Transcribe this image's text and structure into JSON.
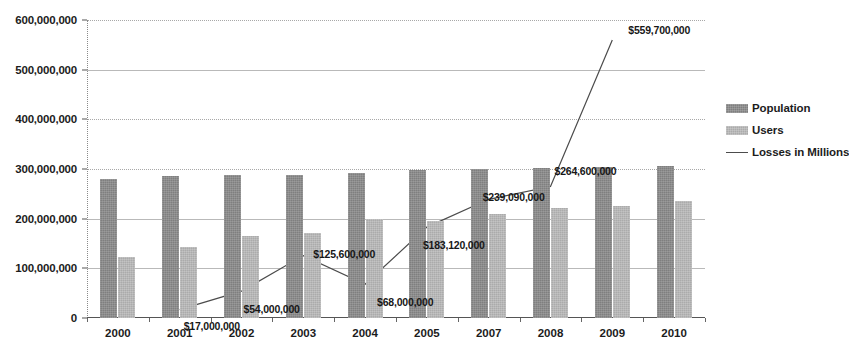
{
  "chart_data": {
    "type": "bar",
    "title": "",
    "xlabel": "",
    "ylabel": "",
    "ylim": [
      0,
      600000000
    ],
    "ytick_values": [
      0,
      100000000,
      200000000,
      300000000,
      400000000,
      500000000,
      600000000
    ],
    "ytick_labels": [
      "0",
      "100,000,000",
      "200,000,000",
      "300,000,000",
      "400,000,000",
      "500,000,000",
      "600,000,000"
    ],
    "grid": true,
    "legend_position": "right",
    "categories": [
      "2000",
      "2001",
      "2002",
      "2003",
      "2004",
      "2005",
      "2007",
      "2008",
      "2009",
      "2010"
    ],
    "series": [
      {
        "name": "Population",
        "type": "bar",
        "color": "#7f7f7f",
        "values": [
          280000000,
          285000000,
          287000000,
          288000000,
          292000000,
          298000000,
          301000000,
          303000000,
          305000000,
          306000000
        ]
      },
      {
        "name": "Users",
        "type": "bar",
        "color": "#ababab",
        "values": [
          122000000,
          142000000,
          165000000,
          172000000,
          199000000,
          196000000,
          210000000,
          221000000,
          225000000,
          235000000
        ]
      },
      {
        "name": "Losses in Millions",
        "type": "line",
        "color": "#4c4c4c",
        "x": [
          "2001",
          "2002",
          "2003",
          "2004",
          "2005",
          "2007",
          "2008",
          "2009"
        ],
        "values": [
          17000000,
          54000000,
          125600000,
          68000000,
          183120000,
          239090000,
          264600000,
          559700000
        ],
        "point_labels": [
          "$17,000,000",
          "$54,000,000",
          "$125,600,000",
          "$68,000,000",
          "$183,120,000",
          "$239,090,000",
          "$264,600,000",
          "$559,700,000"
        ]
      }
    ]
  },
  "legend": {
    "items": [
      {
        "label": "Population"
      },
      {
        "label": "Users"
      },
      {
        "label": "Losses in Millions"
      }
    ]
  }
}
